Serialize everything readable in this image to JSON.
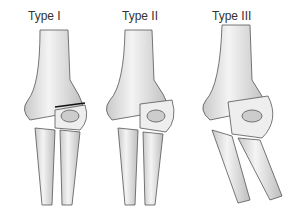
{
  "figure": {
    "panels": [
      {
        "label": "Type I"
      },
      {
        "label": "Type II"
      },
      {
        "label": "Type III"
      }
    ]
  }
}
